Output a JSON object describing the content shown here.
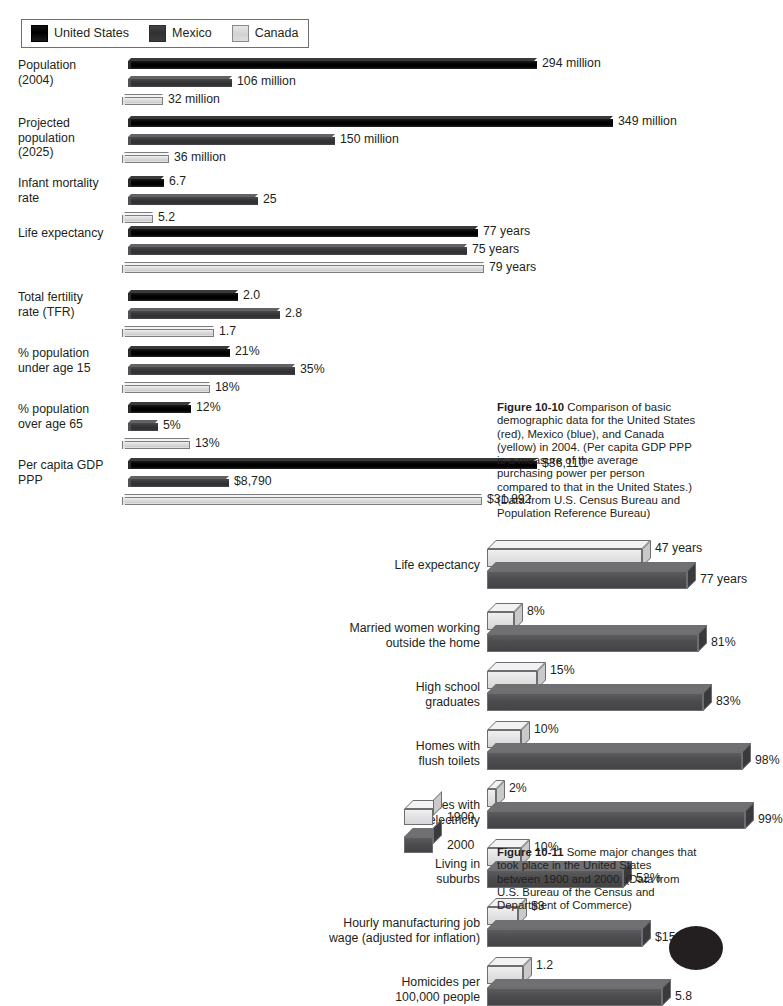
{
  "figure1": {
    "legend": {
      "items": [
        {
          "label": "United States",
          "color": "#000000",
          "key": "us"
        },
        {
          "label": "Mexico",
          "color": "#343436",
          "key": "mx"
        },
        {
          "label": "Canada",
          "color": "#d9d9d9",
          "key": "ca"
        }
      ]
    },
    "caption": {
      "number": "Figure 10-10",
      "text": "Comparison of basic demographic data for the United States (red), Mexico (blue), and Canada (yellow) in 2004. (Per capita GDP PPP is a measure of the average purchasing power per person compared to that in the United States.) (Data from U.S. Census Bureau and Population Reference Bureau)"
    },
    "categories": [
      "Population (2004)",
      "Projected population (2025)",
      "Infant mortality rate",
      "Life expectancy",
      "Total fertility rate (TFR)",
      "% population under age 15",
      "% population over age 65",
      "Per capita GDP PPP"
    ],
    "rows": [
      {
        "label_line1": "Population",
        "label_line2": "(2004)",
        "bars": [
          {
            "series": "us",
            "value": 294,
            "display": "294 million",
            "length": 409
          },
          {
            "series": "mx",
            "value": 106,
            "display": "106 million",
            "length": 104
          },
          {
            "series": "ca",
            "value": 32,
            "display": "32 million",
            "length": 41
          }
        ]
      },
      {
        "label_line1": "Projected population",
        "label_line2": "(2025)",
        "bars": [
          {
            "series": "us",
            "value": 349,
            "display": "349 million",
            "length": 485
          },
          {
            "series": "mx",
            "value": 150,
            "display": "150 million",
            "length": 207
          },
          {
            "series": "ca",
            "value": 36,
            "display": "36 million",
            "length": 47
          }
        ]
      },
      {
        "label_line1": "Infant mortality rate",
        "label_line2": "",
        "bars": [
          {
            "series": "us",
            "value": 6.7,
            "display": "6.7",
            "length": 36
          },
          {
            "series": "mx",
            "value": 25,
            "display": "25",
            "length": 130
          },
          {
            "series": "ca",
            "value": 5.2,
            "display": "5.2",
            "length": 31
          }
        ]
      },
      {
        "label_line1": "Life expectancy",
        "label_line2": "",
        "bars": [
          {
            "series": "us",
            "value": 77,
            "display": "77 years",
            "length": 350
          },
          {
            "series": "mx",
            "value": 75,
            "display": "75 years",
            "length": 339
          },
          {
            "series": "ca",
            "value": 79,
            "display": "79 years",
            "length": 362
          }
        ]
      },
      {
        "label_line1": "Total fertility",
        "label_line2": "rate (TFR)",
        "bars": [
          {
            "series": "us",
            "value": 2.0,
            "display": "2.0",
            "length": 110
          },
          {
            "series": "mx",
            "value": 2.8,
            "display": "2.8",
            "length": 152
          },
          {
            "series": "ca",
            "value": 1.7,
            "display": "1.7",
            "length": 92
          }
        ]
      },
      {
        "label_line1": "% population",
        "label_line2": "under age 15",
        "bars": [
          {
            "series": "us",
            "value": 21,
            "display": "21%",
            "length": 102
          },
          {
            "series": "mx",
            "value": 35,
            "display": "35%",
            "length": 167
          },
          {
            "series": "ca",
            "value": 18,
            "display": "18%",
            "length": 88
          }
        ]
      },
      {
        "label_line1": "% population",
        "label_line2": "over age 65",
        "bars": [
          {
            "series": "us",
            "value": 12,
            "display": "12%",
            "length": 63
          },
          {
            "series": "mx",
            "value": 5,
            "display": "5%",
            "length": 30
          },
          {
            "series": "ca",
            "value": 13,
            "display": "13%",
            "length": 68
          }
        ]
      },
      {
        "label_line1": "Per capita GDP PPP",
        "label_line2": "",
        "bars": [
          {
            "series": "us",
            "value": 36110,
            "display": "$36,110",
            "length": 409
          },
          {
            "series": "mx",
            "value": 8790,
            "display": "$8,790",
            "length": 101
          },
          {
            "series": "ca",
            "value": 31892,
            "display": "$31,892",
            "length": 360
          }
        ]
      }
    ]
  },
  "figure2": {
    "legend": {
      "items": [
        {
          "label": "1900",
          "key": "y1900"
        },
        {
          "label": "2000",
          "key": "y2000"
        }
      ]
    },
    "caption": {
      "number": "Figure 10-11",
      "text": "Some major changes that took place in the United States between 1900 and 2000. (Data from U.S. Bureau of the Census and Department of Commerce)"
    },
    "rows": [
      {
        "label_line1": "Life expectancy",
        "label_line2": "",
        "bars": [
          {
            "series": "y1900",
            "value": 47,
            "display": "47 years",
            "length": 155
          },
          {
            "series": "y2000",
            "value": 77,
            "display": "77 years",
            "length": 200
          }
        ]
      },
      {
        "label_line1": "Married women working",
        "label_line2": "outside the home",
        "bars": [
          {
            "series": "y1900",
            "value": 8,
            "display": "8%",
            "length": 27
          },
          {
            "series": "y2000",
            "value": 81,
            "display": "81%",
            "length": 211
          }
        ]
      },
      {
        "label_line1": "High school",
        "label_line2": "graduates",
        "bars": [
          {
            "series": "y1900",
            "value": 15,
            "display": "15%",
            "length": 50
          },
          {
            "series": "y2000",
            "value": 83,
            "display": "83%",
            "length": 216
          }
        ]
      },
      {
        "label_line1": "Homes with",
        "label_line2": "flush toilets",
        "bars": [
          {
            "series": "y1900",
            "value": 10,
            "display": "10%",
            "length": 34
          },
          {
            "series": "y2000",
            "value": 98,
            "display": "98%",
            "length": 255
          }
        ]
      },
      {
        "label_line1": "Homes with",
        "label_line2": "electricity",
        "bars": [
          {
            "series": "y1900",
            "value": 2,
            "display": "2%",
            "length": 9
          },
          {
            "series": "y2000",
            "value": 99,
            "display": "99%",
            "length": 258
          }
        ]
      },
      {
        "label_line1": "Living in",
        "label_line2": "suburbs",
        "bars": [
          {
            "series": "y1900",
            "value": 10,
            "display": "10%",
            "length": 34
          },
          {
            "series": "y2000",
            "value": 52,
            "display": "52%",
            "length": 136
          }
        ]
      },
      {
        "label_line1": "Hourly manufacturing job",
        "label_line2": "wage (adjusted for inflation)",
        "bars": [
          {
            "series": "y1900",
            "value": 3,
            "display": "$3",
            "length": 31
          },
          {
            "series": "y2000",
            "value": 15,
            "display": "$15",
            "length": 155
          }
        ]
      },
      {
        "label_line1": "Homicides per",
        "label_line2": "100,000 people",
        "bars": [
          {
            "series": "y1900",
            "value": 1.2,
            "display": "1.2",
            "length": 36
          },
          {
            "series": "y2000",
            "value": 5.8,
            "display": "5.8",
            "length": 175
          }
        ]
      }
    ]
  },
  "chart_data": [
    {
      "type": "bar",
      "title": "Figure 10-10 — Comparison of basic demographic data",
      "orientation": "horizontal",
      "grid": false,
      "legend_position": "top-left",
      "categories": [
        "Population (2004)",
        "Projected population (2025)",
        "Infant mortality rate",
        "Life expectancy",
        "Total fertility rate (TFR)",
        "% population under age 15",
        "% population over age 65",
        "Per capita GDP PPP"
      ],
      "series": [
        {
          "name": "United States",
          "values": [
            294,
            349,
            6.7,
            77,
            2.0,
            21,
            12,
            36110
          ],
          "labels": [
            "294 million",
            "349 million",
            "6.7",
            "77 years",
            "2.0",
            "21%",
            "12%",
            "$36,110"
          ]
        },
        {
          "name": "Mexico",
          "values": [
            106,
            150,
            25,
            75,
            2.8,
            35,
            5,
            8790
          ],
          "labels": [
            "106 million",
            "150 million",
            "25",
            "75 years",
            "2.8",
            "35%",
            "5%",
            "$8,790"
          ]
        },
        {
          "name": "Canada",
          "values": [
            32,
            36,
            5.2,
            79,
            1.7,
            18,
            13,
            31892
          ],
          "labels": [
            "32 million",
            "36 million",
            "5.2",
            "79 years",
            "1.7",
            "18%",
            "13%",
            "$31,892"
          ]
        }
      ],
      "xlabel": "",
      "ylabel": ""
    },
    {
      "type": "bar",
      "title": "Figure 10-11 — Some major changes in the United States between 1900 and 2000",
      "orientation": "horizontal",
      "grid": false,
      "legend_position": "right",
      "categories": [
        "Life expectancy",
        "Married women working outside the home",
        "High school graduates",
        "Homes with flush toilets",
        "Homes with electricity",
        "Living in suburbs",
        "Hourly manufacturing job wage (adjusted for inflation)",
        "Homicides per 100,000 people"
      ],
      "series": [
        {
          "name": "1900",
          "values": [
            47,
            8,
            15,
            10,
            2,
            10,
            3,
            1.2
          ],
          "labels": [
            "47 years",
            "8%",
            "15%",
            "10%",
            "2%",
            "10%",
            "$3",
            "1.2"
          ]
        },
        {
          "name": "2000",
          "values": [
            77,
            81,
            83,
            98,
            99,
            52,
            15,
            5.8
          ],
          "labels": [
            "77 years",
            "81%",
            "83%",
            "98%",
            "99%",
            "52%",
            "$15",
            "5.8"
          ]
        }
      ],
      "xlabel": "",
      "ylabel": ""
    }
  ]
}
